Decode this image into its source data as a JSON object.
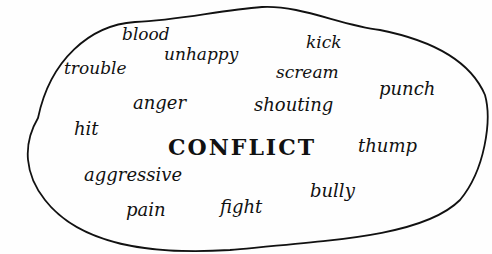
{
  "diagram": {
    "type": "word-web",
    "center_word": "CONFLICT",
    "outline_shape": "hand-drawn irregular oval",
    "colors": {
      "ink": "#111111",
      "background": "#fefefe"
    },
    "words": [
      {
        "text": "blood",
        "x": 122,
        "y": 26,
        "size": 17
      },
      {
        "text": "unhappy",
        "x": 164,
        "y": 46,
        "size": 17
      },
      {
        "text": "kick",
        "x": 306,
        "y": 34,
        "size": 17
      },
      {
        "text": "trouble",
        "x": 64,
        "y": 60,
        "size": 17
      },
      {
        "text": "scream",
        "x": 276,
        "y": 64,
        "size": 17
      },
      {
        "text": "punch",
        "x": 379,
        "y": 80,
        "size": 18
      },
      {
        "text": "anger",
        "x": 133,
        "y": 94,
        "size": 18
      },
      {
        "text": "shouting",
        "x": 254,
        "y": 96,
        "size": 18
      },
      {
        "text": "hit",
        "x": 74,
        "y": 120,
        "size": 18
      },
      {
        "text": "thump",
        "x": 358,
        "y": 137,
        "size": 18
      },
      {
        "text": "aggressive",
        "x": 84,
        "y": 166,
        "size": 18
      },
      {
        "text": "bully",
        "x": 310,
        "y": 182,
        "size": 18
      },
      {
        "text": "fight",
        "x": 220,
        "y": 198,
        "size": 18
      },
      {
        "text": "pain",
        "x": 126,
        "y": 201,
        "size": 18
      }
    ],
    "center": {
      "x": 168,
      "y": 136,
      "size": 22
    }
  }
}
